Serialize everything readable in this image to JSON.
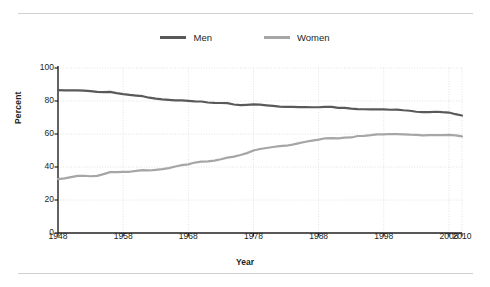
{
  "chart_data": {
    "type": "line",
    "title": "",
    "xlabel": "Year",
    "ylabel": "Percent",
    "xlim": [
      1948,
      2010
    ],
    "ylim": [
      0,
      100
    ],
    "grid": true,
    "legend_position": "top-center",
    "xticks": [
      "1948",
      "1958",
      "1968",
      "1978",
      "1988",
      "1998",
      "2008",
      "2010"
    ],
    "xtick_values": [
      1948,
      1958,
      1968,
      1978,
      1988,
      1998,
      2008,
      2010
    ],
    "yticks": [
      "0",
      "20",
      "40",
      "60",
      "80",
      "100"
    ],
    "ytick_values": [
      0,
      20,
      40,
      60,
      80,
      100
    ],
    "x": [
      1948,
      1949,
      1950,
      1951,
      1952,
      1953,
      1954,
      1955,
      1956,
      1957,
      1958,
      1959,
      1960,
      1961,
      1962,
      1963,
      1964,
      1965,
      1966,
      1967,
      1968,
      1969,
      1970,
      1971,
      1972,
      1973,
      1974,
      1975,
      1976,
      1977,
      1978,
      1979,
      1980,
      1981,
      1982,
      1983,
      1984,
      1985,
      1986,
      1987,
      1988,
      1989,
      1990,
      1991,
      1992,
      1993,
      1994,
      1995,
      1996,
      1997,
      1998,
      1999,
      2000,
      2001,
      2002,
      2003,
      2004,
      2005,
      2006,
      2007,
      2008,
      2009,
      2010
    ],
    "series": [
      {
        "name": "Men",
        "color": "#595959",
        "values": [
          86.6,
          86.4,
          86.4,
          86.5,
          86.3,
          86.0,
          85.5,
          85.4,
          85.5,
          84.8,
          84.2,
          83.7,
          83.3,
          82.9,
          82.0,
          81.4,
          81.0,
          80.7,
          80.4,
          80.4,
          80.1,
          79.8,
          79.7,
          79.1,
          78.9,
          78.8,
          78.7,
          77.9,
          77.5,
          77.7,
          77.9,
          77.8,
          77.4,
          77.0,
          76.6,
          76.4,
          76.4,
          76.3,
          76.3,
          76.2,
          76.2,
          76.4,
          76.4,
          75.8,
          75.8,
          75.4,
          75.1,
          75.0,
          74.9,
          75.0,
          74.9,
          74.7,
          74.8,
          74.4,
          74.1,
          73.5,
          73.3,
          73.3,
          73.5,
          73.2,
          73.0,
          72.0,
          71.2
        ]
      },
      {
        "name": "Women",
        "color": "#a6a6a6",
        "values": [
          32.7,
          33.1,
          33.9,
          34.6,
          34.7,
          34.4,
          34.6,
          35.7,
          36.9,
          36.9,
          37.1,
          37.1,
          37.7,
          38.1,
          37.9,
          38.3,
          38.7,
          39.3,
          40.3,
          41.1,
          41.6,
          42.7,
          43.3,
          43.4,
          43.9,
          44.7,
          45.7,
          46.3,
          47.3,
          48.4,
          50.0,
          50.9,
          51.5,
          52.1,
          52.6,
          52.9,
          53.6,
          54.5,
          55.3,
          56.0,
          56.6,
          57.4,
          57.5,
          57.4,
          57.8,
          57.9,
          58.8,
          58.9,
          59.3,
          59.8,
          59.8,
          60.0,
          59.9,
          59.8,
          59.6,
          59.5,
          59.2,
          59.3,
          59.4,
          59.3,
          59.5,
          59.2,
          58.6
        ]
      }
    ]
  },
  "legend": {
    "items": [
      {
        "label": "Men",
        "color": "#595959"
      },
      {
        "label": "Women",
        "color": "#a6a6a6"
      }
    ]
  },
  "axes": {
    "y_title": "Percent",
    "x_title": "Year"
  },
  "colors": {
    "men": "#595959",
    "women": "#a6a6a6",
    "axis": "#231f20",
    "grid": "#e2e2e2",
    "rule": "#d0d0d0"
  }
}
